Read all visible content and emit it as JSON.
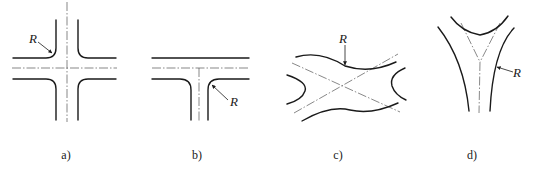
{
  "figure": {
    "panels": [
      {
        "id": "a",
        "caption": "a)",
        "type": "four-way intersection",
        "radius_label": "R"
      },
      {
        "id": "b",
        "caption": "b)",
        "type": "T intersection",
        "radius_label": "R"
      },
      {
        "id": "c",
        "caption": "c)",
        "type": "oblique X intersection",
        "radius_label": "R"
      },
      {
        "id": "d",
        "caption": "d)",
        "type": "Y intersection",
        "radius_label": "R"
      }
    ]
  },
  "colors": {
    "line": "#1a1a1a",
    "centerline": "#555555",
    "background": "#ffffff"
  }
}
